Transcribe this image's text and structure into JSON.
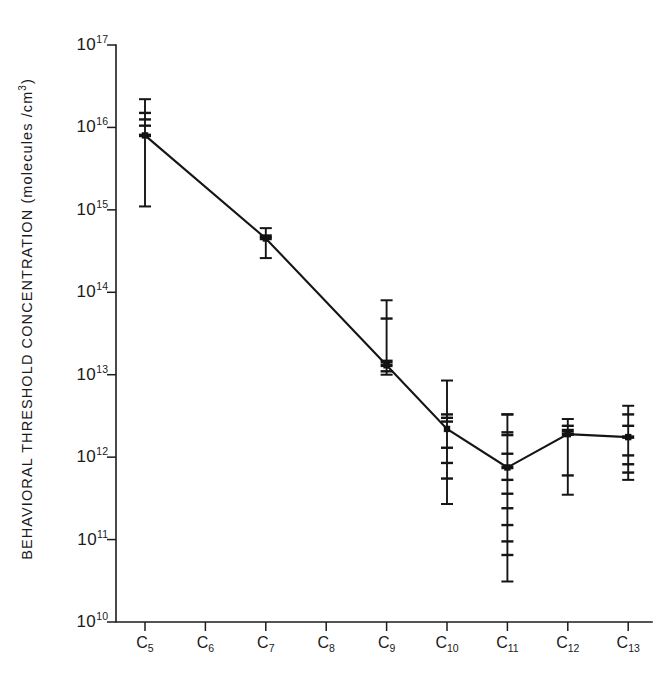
{
  "chart_data": {
    "type": "line",
    "title": "",
    "subtitle": "",
    "xlabel": "",
    "ylabel": "BEHAVIORAL THRESHOLD CONCENTRATION  (molecules /cm",
    "ylabel_superscript": "3",
    "ylabel_suffix": ")",
    "legend": [],
    "legend_position": "none",
    "grid": false,
    "yscale": "log",
    "ylim": [
      10000000000.0,
      1e+17
    ],
    "ytick_labels": [
      "10¹⁷",
      "10¹⁶",
      "10¹⁵",
      "10¹⁴",
      "10¹³",
      "10¹²",
      "10¹¹",
      "10¹⁰"
    ],
    "ytick_base": "10",
    "ytick_exponents": [
      "17",
      "16",
      "15",
      "14",
      "13",
      "12",
      "11",
      "10"
    ],
    "ytick_values": [
      1e+17,
      1e+16,
      1000000000000000.0,
      100000000000000.0,
      10000000000000.0,
      1000000000000.0,
      100000000000.0,
      10000000000.0
    ],
    "categories": [
      "C5",
      "C6",
      "C7",
      "C8",
      "C9",
      "C10",
      "C11",
      "C12",
      "C13"
    ],
    "xtick_base": "C",
    "xtick_subscripts": [
      "5",
      "6",
      "7",
      "8",
      "9",
      "10",
      "11",
      "12",
      "13"
    ],
    "series": [
      {
        "name": "behavioral threshold",
        "x": [
          "C5",
          "C7",
          "C9",
          "C10",
          "C11",
          "C12",
          "C13"
        ],
        "values": [
          8000000000000000.0,
          450000000000000.0,
          13000000000000.0,
          2200000000000.0,
          750000000000.0,
          1900000000000.0,
          1750000000000.0
        ]
      }
    ],
    "points": [
      {
        "category": "C5",
        "value": 8000000000000000.0,
        "err_low": 1100000000000000.0,
        "err_high": 2.2e+16,
        "observations": [
          1.5e+16,
          1.25e+16,
          1.05e+16,
          8000000000000000.0
        ]
      },
      {
        "category": "C7",
        "value": 450000000000000.0,
        "err_low": 260000000000000.0,
        "err_high": 600000000000000.0,
        "observations": [
          480000000000000.0,
          450000000000000.0
        ]
      },
      {
        "category": "C9",
        "value": 13000000000000.0,
        "err_low": 10000000000000.0,
        "err_high": 80000000000000.0,
        "observations": [
          48000000000000.0,
          14500000000000.0,
          13000000000000.0,
          11000000000000.0
        ]
      },
      {
        "category": "C10",
        "value": 2200000000000.0,
        "err_low": 270000000000.0,
        "err_high": 8500000000000.0,
        "observations": [
          3300000000000.0,
          3000000000000.0,
          2700000000000.0,
          1300000000000.0,
          850000000000.0,
          550000000000.0
        ]
      },
      {
        "category": "C11",
        "value": 750000000000.0,
        "err_low": 31000000000.0,
        "err_high": 3300000000000.0,
        "observations": [
          3300000000000.0,
          2000000000000.0,
          1850000000000.0,
          1100000000000.0,
          750000000000.0,
          530000000000.0,
          360000000000.0,
          240000000000.0,
          150000000000.0,
          95000000000.0,
          65000000000.0
        ]
      },
      {
        "category": "C12",
        "value": 1900000000000.0,
        "err_low": 350000000000.0,
        "err_high": 2900000000000.0,
        "observations": [
          2400000000000.0,
          2100000000000.0,
          1900000000000.0,
          600000000000.0
        ]
      },
      {
        "category": "C13",
        "value": 1750000000000.0,
        "err_low": 530000000000.0,
        "err_high": 4200000000000.0,
        "observations": [
          3300000000000.0,
          2400000000000.0,
          1750000000000.0,
          1050000000000.0,
          820000000000.0,
          650000000000.0
        ]
      }
    ]
  },
  "figure": {
    "background": "#ffffff",
    "ink_color": "#151515"
  }
}
